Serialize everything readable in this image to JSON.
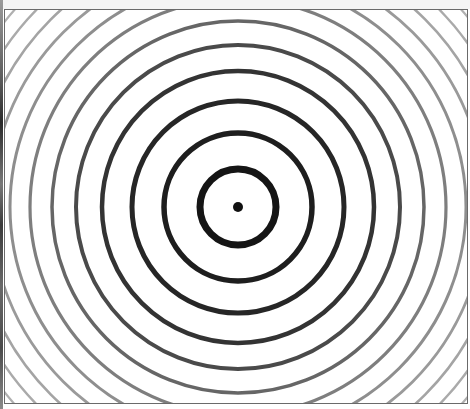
{
  "figure": {
    "center": {
      "x": 237,
      "y": 206
    },
    "center_dot_radius": 5,
    "rings": [
      {
        "r": 38,
        "stroke": 7,
        "color": "#151515"
      },
      {
        "r": 74,
        "stroke": 5.5,
        "color": "#1e1e1e"
      },
      {
        "r": 106,
        "stroke": 5,
        "color": "#262626"
      },
      {
        "r": 136,
        "stroke": 4.5,
        "color": "#333333"
      },
      {
        "r": 162,
        "stroke": 4,
        "color": "#4a4a4a"
      },
      {
        "r": 186,
        "stroke": 3.5,
        "color": "#666666"
      },
      {
        "r": 208,
        "stroke": 3.2,
        "color": "#7e7e7e"
      },
      {
        "r": 228,
        "stroke": 3,
        "color": "#8e8e8e"
      },
      {
        "r": 247,
        "stroke": 2.8,
        "color": "#9a9a9a"
      },
      {
        "r": 265,
        "stroke": 2.6,
        "color": "#a4a4a4"
      },
      {
        "r": 282,
        "stroke": 2.4,
        "color": "#aaaaaa"
      },
      {
        "r": 298,
        "stroke": 2.2,
        "color": "#b0b0b0"
      },
      {
        "r": 313,
        "stroke": 2.1,
        "color": "#b4b4b4"
      },
      {
        "r": 328,
        "stroke": 2,
        "color": "#b8b8b8"
      }
    ],
    "colors": {
      "background": "#ffffff",
      "frame": "#6a6a6a"
    }
  }
}
